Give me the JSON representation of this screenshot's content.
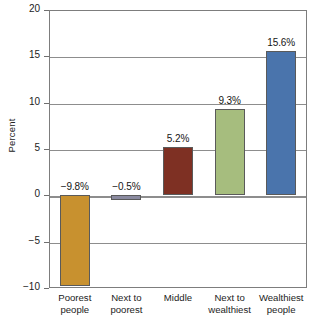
{
  "chart_data": {
    "type": "bar",
    "title": "",
    "xlabel": "",
    "ylabel": "Percent",
    "categories": [
      "Poorest people",
      "Next to poorest",
      "Middle",
      "Next to wealthiest",
      "Wealthiest people"
    ],
    "category_lines": [
      [
        "Poorest",
        "people"
      ],
      [
        "Next to",
        "poorest"
      ],
      [
        "Middle",
        ""
      ],
      [
        "Next to",
        "wealthiest"
      ],
      [
        "Wealthiest",
        "people"
      ]
    ],
    "values": [
      -9.8,
      -0.5,
      5.2,
      9.3,
      15.6
    ],
    "value_labels": [
      "−9.8%",
      "−0.5%",
      "5.2%",
      "9.3%",
      "15.6%"
    ],
    "bar_colors": [
      "#c8912f",
      "#8a8aa0",
      "#7e3023",
      "#a6bd7e",
      "#4a74ac"
    ],
    "bar_border_color": "#5a5a5a",
    "ylim": [
      -10,
      20
    ],
    "yticks": [
      20,
      15,
      10,
      5,
      0,
      -5,
      -10
    ],
    "ytick_labels": [
      "20",
      "15",
      "10",
      "5",
      "0",
      "−5",
      "−10"
    ],
    "grid": true,
    "grid_color": "#8d8d8d",
    "legend": "none",
    "frame_color": "#7d7d7d",
    "background": "#ffffff"
  }
}
